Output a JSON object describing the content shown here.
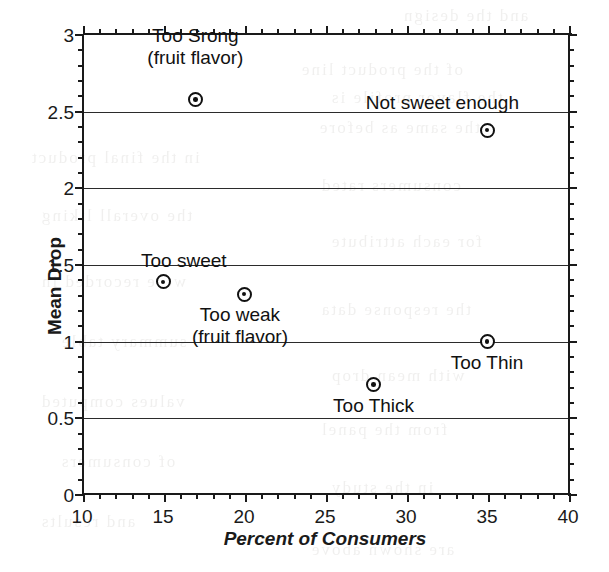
{
  "chart_data": {
    "type": "scatter",
    "title": "",
    "xlabel": "Percent of Consumers",
    "ylabel": "Mean Drop",
    "xlim": [
      10,
      40
    ],
    "ylim": [
      0,
      3
    ],
    "xticks": [
      10,
      15,
      20,
      25,
      30,
      35,
      40
    ],
    "xtick_labels": [
      "10",
      "15",
      "20",
      "25",
      "30",
      "35",
      "40"
    ],
    "x_minor_step": 1,
    "yticks": [
      0,
      0.5,
      1,
      1.5,
      2,
      2.5,
      3
    ],
    "ytick_labels": [
      "0",
      "0.5",
      "1",
      "1.5",
      "2",
      "2.5",
      "3"
    ],
    "y_minor_step": 0.1,
    "grid": "horizontal-major",
    "gridlines_y": [
      0.5,
      1,
      1.5,
      2,
      2.5
    ],
    "legend": "none",
    "marker": "circle-with-center-dot",
    "points": [
      {
        "label": "Too Srong\n(fruit flavor)",
        "x": 17,
        "y": 2.58,
        "label_pos": "above-center"
      },
      {
        "label": "Not sweet enough",
        "x": 35,
        "y": 2.38,
        "label_pos": "above-right"
      },
      {
        "label": "Too sweet",
        "x": 15,
        "y": 1.39,
        "label_pos": "above-left"
      },
      {
        "label": "Too weak\n(fruit flavor)",
        "x": 20,
        "y": 1.31,
        "label_pos": "below-center"
      },
      {
        "label": "Too Thin",
        "x": 35,
        "y": 1.0,
        "label_pos": "below-center"
      },
      {
        "label": "Too Thick",
        "x": 28,
        "y": 0.72,
        "label_pos": "below-center"
      }
    ]
  },
  "annotations": {
    "too_strong_line1": "Too Srong",
    "too_strong_line2": "(fruit flavor)",
    "not_sweet_enough": "Not sweet enough",
    "too_sweet": "Too sweet",
    "too_weak_line1": "Too weak",
    "too_weak_line2": "(fruit flavor)",
    "too_thin": "Too Thin",
    "too_thick": "Too Thick"
  },
  "ghost_text": [
    {
      "t": "and the design",
      "x": 402,
      "y": 6
    },
    {
      "t": "of the product line",
      "x": 300,
      "y": 60
    },
    {
      "t": "the flavor profile is",
      "x": 330,
      "y": 88
    },
    {
      "t": "the same as before",
      "x": 318,
      "y": 118
    },
    {
      "t": "in the final product",
      "x": 30,
      "y": 148
    },
    {
      "t": "consumers rated",
      "x": 320,
      "y": 176
    },
    {
      "t": "the overall liking",
      "x": 40,
      "y": 206
    },
    {
      "t": "for each attribute",
      "x": 330,
      "y": 232
    },
    {
      "t": "were recorded in",
      "x": 40,
      "y": 272
    },
    {
      "t": "the response data",
      "x": 320,
      "y": 300
    },
    {
      "t": "summary table",
      "x": 60,
      "y": 332
    },
    {
      "t": "with mean drop",
      "x": 330,
      "y": 366
    },
    {
      "t": "values computed",
      "x": 40,
      "y": 392
    },
    {
      "t": "from the panel",
      "x": 320,
      "y": 420
    },
    {
      "t": "of consumers",
      "x": 60,
      "y": 452
    },
    {
      "t": "in the study",
      "x": 330,
      "y": 478
    },
    {
      "t": "and results",
      "x": 40,
      "y": 512
    },
    {
      "t": "are shown above",
      "x": 310,
      "y": 540
    }
  ]
}
